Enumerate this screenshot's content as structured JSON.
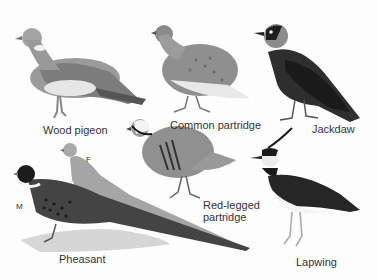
{
  "plate": {
    "background": "#fdfdfd",
    "birds": [
      {
        "id": "wood-pigeon",
        "label": "Wood pigeon"
      },
      {
        "id": "common-partridge",
        "label": "Common partridge"
      },
      {
        "id": "jackdaw",
        "label": "Jackdaw"
      },
      {
        "id": "red-legged-partridge",
        "label_line1": "Red-legged",
        "label_line2": "partridge"
      },
      {
        "id": "pheasant",
        "label": "Pheasant",
        "male_marker": "M",
        "female_marker": "F"
      },
      {
        "id": "lapwing",
        "label": "Lapwing"
      }
    ]
  }
}
